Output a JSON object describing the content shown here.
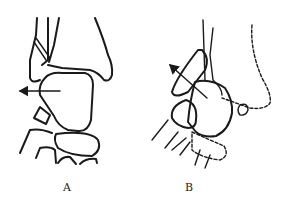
{
  "figure": {
    "panels": [
      {
        "id": "A",
        "label": "A",
        "arrow_direction": "left"
      },
      {
        "id": "B",
        "label": "B",
        "arrow_direction": "up-left"
      }
    ],
    "colors": {
      "line": "#1a1a1a",
      "background": "#ffffff"
    }
  }
}
